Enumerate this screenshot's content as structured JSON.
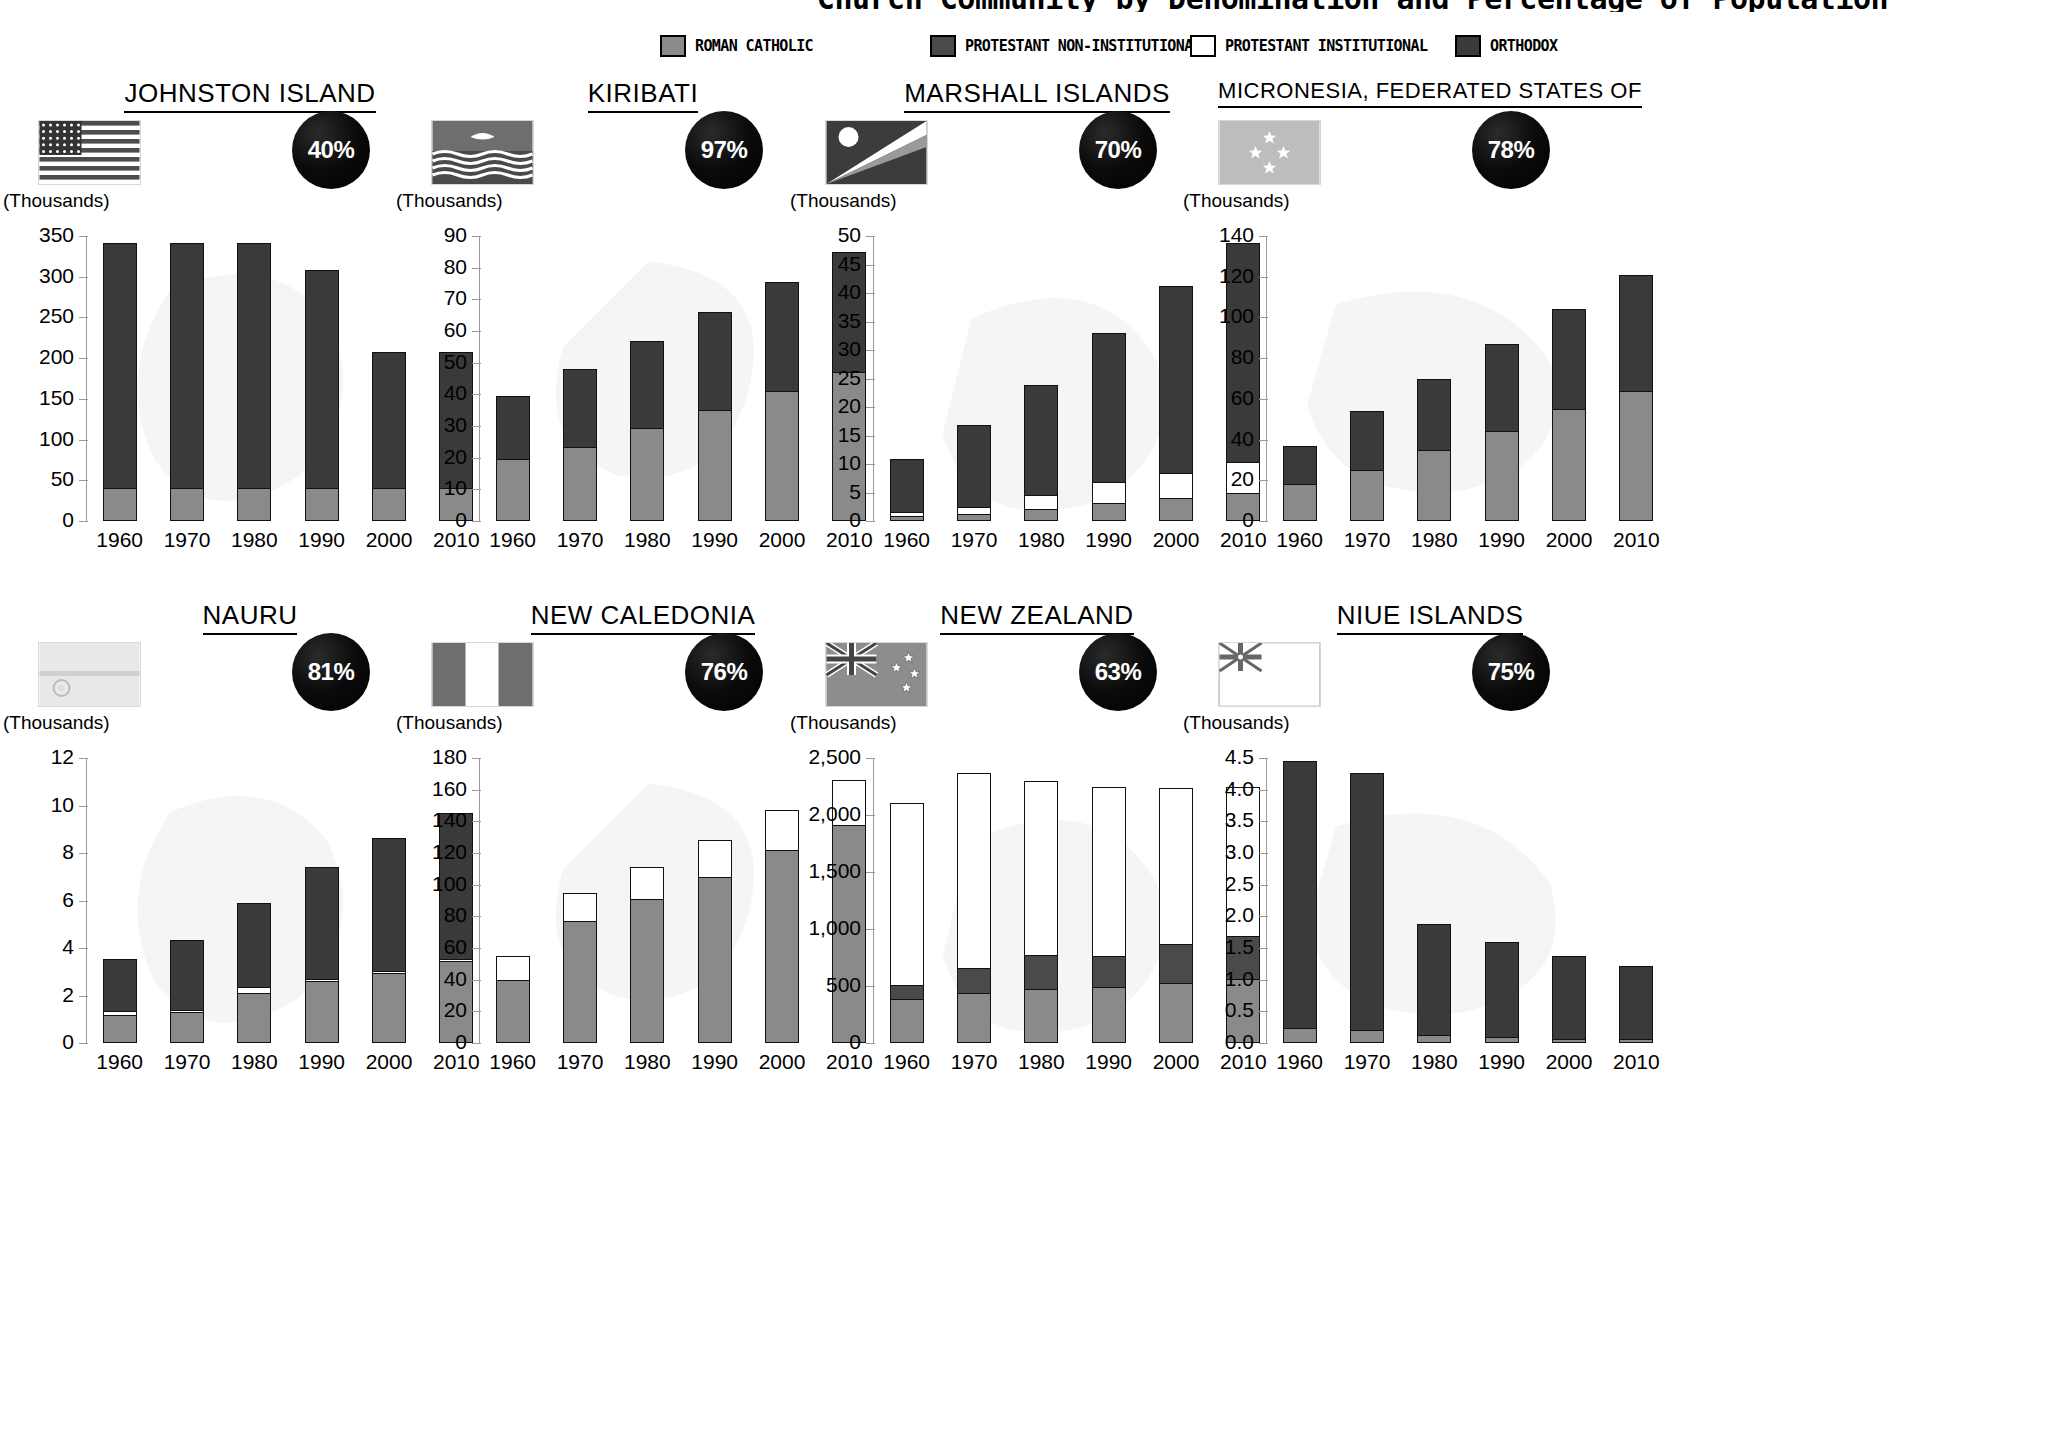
{
  "header": {
    "title": "Church Community by Denomination and Percentage of Population",
    "legend": [
      {
        "label": "ROMAN CATHOLIC",
        "color": "#8a8a8a",
        "key": "roman_catholic",
        "x": 0
      },
      {
        "label": "PROTESTANT NON-INSTITUTIONAL",
        "color": "#4a4a4a",
        "key": "protestant_non_inst",
        "x": 270
      },
      {
        "label": "PROTESTANT INSTITUTIONAL",
        "color": "#ffffff",
        "key": "protestant_inst",
        "x": 530
      },
      {
        "label": "ORTHODOX",
        "color": "#3a3a3a",
        "key": "orthodox",
        "x": 795
      }
    ]
  },
  "units_label": "(Thousands)",
  "years": [
    "1960",
    "1970",
    "1980",
    "1990",
    "2000",
    "2010"
  ],
  "chart_data": [
    {
      "type": "bar",
      "title": "JOHNSTON ISLAND",
      "percent": "40%",
      "flag": "united-states-flag",
      "ylabel": "(Thousands)",
      "categories": [
        "1960",
        "1970",
        "1980",
        "1990",
        "2000",
        "2010"
      ],
      "ylim": [
        0,
        350
      ],
      "yticks": [
        0,
        50,
        100,
        150,
        200,
        250,
        300,
        350
      ],
      "ytick_labels": [
        "0",
        "50",
        "100",
        "150",
        "200",
        "250",
        "300",
        "350"
      ],
      "series": [
        {
          "name": "ROMAN CATHOLIC",
          "values": [
            40,
            40,
            40,
            40,
            40,
            40
          ]
        },
        {
          "name": "PROTESTANT NON-INSTITUTIONAL",
          "values": [
            0,
            0,
            0,
            0,
            0,
            0
          ]
        },
        {
          "name": "PROTESTANT INSTITUTIONAL",
          "values": [
            0,
            0,
            0,
            0,
            0,
            0
          ]
        },
        {
          "name": "ORTHODOX",
          "values": [
            301,
            301,
            301,
            268,
            168,
            168
          ]
        }
      ],
      "totals": [
        341,
        341,
        341,
        308,
        208,
        208
      ]
    },
    {
      "type": "bar",
      "title": "KIRIBATI",
      "percent": "97%",
      "flag": "kiribati-flag",
      "ylabel": "(Thousands)",
      "categories": [
        "1960",
        "1970",
        "1980",
        "1990",
        "2000",
        "2010"
      ],
      "ylim": [
        0,
        90
      ],
      "yticks": [
        0,
        10,
        20,
        30,
        40,
        50,
        60,
        70,
        80,
        90
      ],
      "ytick_labels": [
        "0",
        "10",
        "20",
        "30",
        "40",
        "50",
        "60",
        "70",
        "80",
        "90"
      ],
      "series": [
        {
          "name": "ROMAN CATHOLIC",
          "values": [
            19.5,
            23.5,
            29.5,
            35,
            41,
            47
          ]
        },
        {
          "name": "PROTESTANT NON-INSTITUTIONAL",
          "values": [
            0,
            0,
            0,
            0,
            0,
            0
          ]
        },
        {
          "name": "PROTESTANT INSTITUTIONAL",
          "values": [
            0,
            0,
            0,
            0,
            0,
            0
          ]
        },
        {
          "name": "ORTHODOX",
          "values": [
            20,
            24.5,
            27.5,
            31,
            34.5,
            38
          ]
        }
      ],
      "totals": [
        39.5,
        48,
        57,
        66,
        75.5,
        85
      ]
    },
    {
      "type": "bar",
      "title": "MARSHALL ISLANDS",
      "percent": "70%",
      "flag": "marshall-islands-flag",
      "ylabel": "(Thousands)",
      "categories": [
        "1960",
        "1970",
        "1980",
        "1990",
        "2000",
        "2010"
      ],
      "ylim": [
        0,
        50
      ],
      "yticks": [
        0,
        5,
        10,
        15,
        20,
        25,
        30,
        35,
        40,
        45,
        50
      ],
      "ytick_labels": [
        "0",
        "5",
        "10",
        "15",
        "20",
        "25",
        "30",
        "35",
        "40",
        "45",
        "50"
      ],
      "series": [
        {
          "name": "ROMAN CATHOLIC",
          "values": [
            0.8,
            1.3,
            2.1,
            3.1,
            4.1,
            5.0
          ]
        },
        {
          "name": "PROTESTANT NON-INSTITUTIONAL",
          "values": [
            0,
            0,
            0,
            0,
            0,
            0
          ]
        },
        {
          "name": "PROTESTANT INSTITUTIONAL",
          "values": [
            0.7,
            1.2,
            2.5,
            3.8,
            4.3,
            5.3
          ]
        },
        {
          "name": "ORTHODOX",
          "values": [
            9.3,
            14.3,
            19.3,
            26.0,
            32.8,
            38.4
          ]
        }
      ],
      "totals": [
        10.8,
        16.8,
        23.9,
        32.9,
        41.2,
        48.7
      ]
    },
    {
      "type": "bar",
      "title": "MICRONESIA, FEDERATED STATES OF",
      "percent": "78%",
      "flag": "micronesia-flag",
      "ylabel": "(Thousands)",
      "categories": [
        "1960",
        "1970",
        "1980",
        "1990",
        "2000",
        "2010"
      ],
      "ylim": [
        0,
        140
      ],
      "yticks": [
        0,
        20,
        40,
        60,
        80,
        100,
        120,
        140
      ],
      "ytick_labels": [
        "0",
        "20",
        "40",
        "60",
        "80",
        "100",
        "120",
        "140"
      ],
      "series": [
        {
          "name": "ROMAN CATHOLIC",
          "values": [
            18,
            25,
            35,
            44,
            55,
            64
          ]
        },
        {
          "name": "PROTESTANT NON-INSTITUTIONAL",
          "values": [
            0,
            0,
            0,
            0,
            0,
            0
          ]
        },
        {
          "name": "PROTESTANT INSTITUTIONAL",
          "values": [
            0,
            0,
            0,
            0,
            0,
            0
          ]
        },
        {
          "name": "ORTHODOX",
          "values": [
            19,
            29,
            35,
            43,
            49,
            57
          ]
        }
      ],
      "totals": [
        37,
        54,
        70,
        87,
        104,
        121
      ]
    },
    {
      "type": "bar",
      "title": "NAURU",
      "percent": "81%",
      "flag": "nauru-flag",
      "ylabel": "(Thousands)",
      "categories": [
        "1960",
        "1970",
        "1980",
        "1990",
        "2000",
        "2010"
      ],
      "ylim": [
        0,
        12
      ],
      "yticks": [
        0,
        2,
        4,
        6,
        8,
        10,
        12
      ],
      "ytick_labels": [
        "0",
        "2",
        "4",
        "6",
        "8",
        "10",
        "12"
      ],
      "series": [
        {
          "name": "ROMAN CATHOLIC",
          "values": [
            1.2,
            1.3,
            2.1,
            2.6,
            2.95,
            3.45
          ]
        },
        {
          "name": "PROTESTANT NON-INSTITUTIONAL",
          "values": [
            0,
            0,
            0,
            0,
            0,
            0
          ]
        },
        {
          "name": "PROTESTANT INSTITUTIONAL",
          "values": [
            0.15,
            0.1,
            0.25,
            0.1,
            0.1,
            0.1
          ]
        },
        {
          "name": "ORTHODOX",
          "values": [
            2.2,
            2.95,
            3.55,
            4.7,
            5.6,
            6.15
          ]
        }
      ],
      "totals": [
        3.55,
        4.35,
        5.9,
        7.4,
        8.65,
        9.7
      ]
    },
    {
      "type": "bar",
      "title": "NEW CALEDONIA",
      "percent": "76%",
      "flag": "new-caledonia-flag",
      "ylabel": "(Thousands)",
      "categories": [
        "1960",
        "1970",
        "1980",
        "1990",
        "2000",
        "2010"
      ],
      "ylim": [
        0,
        180
      ],
      "yticks": [
        0,
        20,
        40,
        60,
        80,
        100,
        120,
        140,
        160,
        180
      ],
      "ytick_labels": [
        "0",
        "20",
        "40",
        "60",
        "80",
        "100",
        "120",
        "140",
        "160",
        "180"
      ],
      "series": [
        {
          "name": "ROMAN CATHOLIC",
          "values": [
            40,
            77,
            91,
            105,
            122,
            138
          ]
        },
        {
          "name": "PROTESTANT NON-INSTITUTIONAL",
          "values": [
            0,
            0,
            0,
            0,
            0,
            0
          ]
        },
        {
          "name": "PROTESTANT INSTITUTIONAL",
          "values": [
            15,
            18,
            20,
            23,
            25,
            28
          ]
        },
        {
          "name": "ORTHODOX",
          "values": [
            0,
            0,
            0,
            0,
            0,
            0
          ]
        }
      ],
      "totals": [
        55,
        95,
        111,
        128,
        147,
        166
      ]
    },
    {
      "type": "bar",
      "title": "NEW ZEALAND",
      "percent": "63%",
      "flag": "new-zealand-flag",
      "ylabel": "(Thousands)",
      "categories": [
        "1960",
        "1970",
        "1980",
        "1990",
        "2000",
        "2010"
      ],
      "ylim": [
        0,
        2500
      ],
      "yticks": [
        0,
        500,
        1000,
        1500,
        2000,
        2500
      ],
      "ytick_labels": [
        "0",
        "500",
        "1,000",
        "1,500",
        "2,000",
        "2,500"
      ],
      "series": [
        {
          "name": "ROMAN CATHOLIC",
          "values": [
            390,
            440,
            470,
            490,
            530,
            560
          ]
        },
        {
          "name": "PROTESTANT NON-INSTITUTIONAL",
          "values": [
            115,
            215,
            305,
            275,
            340,
            375
          ]
        },
        {
          "name": "PROTESTANT INSTITUTIONAL",
          "values": [
            1600,
            1710,
            1520,
            1480,
            1370,
            1310
          ]
        },
        {
          "name": "ORTHODOX",
          "values": [
            0,
            0,
            0,
            0,
            0,
            0
          ]
        }
      ],
      "totals": [
        2105,
        2365,
        2295,
        2245,
        2240,
        2245
      ]
    },
    {
      "type": "bar",
      "title": "NIUE ISLANDS",
      "percent": "75%",
      "flag": "niue-flag",
      "ylabel": "(Thousands)",
      "categories": [
        "1960",
        "1970",
        "1980",
        "1990",
        "2000",
        "2010"
      ],
      "ylim": [
        0,
        4.5
      ],
      "yticks": [
        0,
        0.5,
        1.0,
        1.5,
        2.0,
        2.5,
        3.0,
        3.5,
        4.0,
        4.5
      ],
      "ytick_labels": [
        "0.0",
        "0.5",
        "1.0",
        "1.5",
        "2.0",
        "2.5",
        "3.0",
        "3.5",
        "4.0",
        "4.5"
      ],
      "series": [
        {
          "name": "ROMAN CATHOLIC",
          "values": [
            0.24,
            0.2,
            0.13,
            0.09,
            0.07,
            0.06
          ]
        },
        {
          "name": "PROTESTANT NON-INSTITUTIONAL",
          "values": [
            0,
            0,
            0,
            0,
            0,
            0
          ]
        },
        {
          "name": "PROTESTANT INSTITUTIONAL",
          "values": [
            0,
            0,
            0,
            0,
            0,
            0
          ]
        },
        {
          "name": "ORTHODOX",
          "values": [
            4.21,
            4.07,
            1.75,
            1.51,
            1.3,
            1.16
          ]
        }
      ],
      "totals": [
        4.45,
        4.27,
        1.88,
        1.6,
        1.37,
        1.22
      ]
    }
  ]
}
